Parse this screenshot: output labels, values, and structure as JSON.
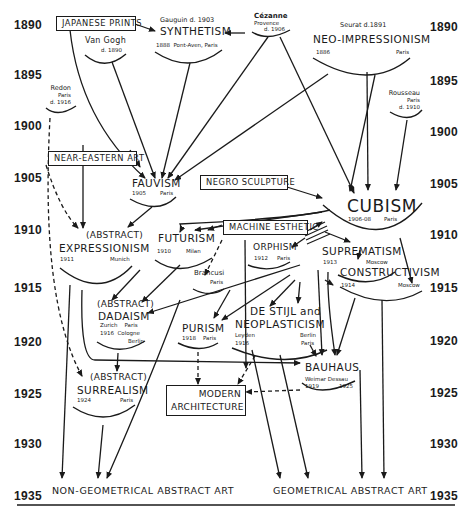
{
  "years": {
    "left": [
      "1890",
      "1895",
      "1900",
      "1905",
      "1910",
      "1915",
      "1920",
      "1925",
      "1930",
      "1935"
    ],
    "right": [
      "1890",
      "1895",
      "1900",
      "1905",
      "1910",
      "1915",
      "1920",
      "1925",
      "1930",
      "1935"
    ]
  },
  "boxes": {
    "japanese_prints": "JAPANESE PRINTS",
    "near_eastern_art": "NEAR-EASTERN ART",
    "negro_sculpture": "NEGRO SCULPTURE",
    "machine_esthetic": "MACHINE ESTHETIC",
    "modern_architecture_1": "MODERN",
    "modern_architecture_2": "ARCHITECTURE"
  },
  "nodes": {
    "van_gogh": {
      "name": "Van Gogh",
      "date": "d. 1890"
    },
    "gauguin": {
      "name": "Gauguin",
      "date": "d. 1903"
    },
    "synthetism": {
      "title": "SYNTHETISM",
      "year": "1888",
      "place": "Pont-Aven, Paris"
    },
    "cezanne": {
      "name": "Cézanne",
      "place": "Provence",
      "date": "d. 1906"
    },
    "seurat": {
      "name": "Seurat",
      "date": "d.1891"
    },
    "neo_impressionism": {
      "title": "NEO-IMPRESSIONISM",
      "year": "1886",
      "place": "Paris"
    },
    "redon": {
      "name": "Redon",
      "place": "Paris",
      "date": "d. 1916"
    },
    "rousseau": {
      "name": "Rousseau",
      "place": "Paris",
      "date": "d. 1910"
    },
    "fauvism": {
      "title": "FAUVISM",
      "year": "1905",
      "place": "Paris"
    },
    "cubism": {
      "title": "CUBISM",
      "year": "1906-08",
      "place": "Paris"
    },
    "abstract_expressionism": {
      "prefix": "(ABSTRACT)",
      "title": "EXPRESSIONISM",
      "year": "1911",
      "place": "Munich"
    },
    "futurism": {
      "title": "FUTURISM",
      "year": "1910",
      "place": "Milan"
    },
    "orphism": {
      "title": "ORPHISM",
      "year": "1912",
      "place": "Paris"
    },
    "suprematism": {
      "title": "SUPREMATISM",
      "year": "1913",
      "place": "Moscow"
    },
    "constructivism": {
      "title": "CONSTRUCTIVISM",
      "year": "1914",
      "place": "Moscow"
    },
    "brancusi": {
      "name": "Brancusi",
      "place": "Paris"
    },
    "abstract_dadaism": {
      "prefix": "(ABSTRACT)",
      "title": "DADAISM",
      "places1": "Zurich    Paris",
      "places2": "1916  Cologne",
      "places3": "Berlin"
    },
    "purism": {
      "title": "PURISM",
      "year": "1918",
      "place": "Paris"
    },
    "de_stijl": {
      "title1": "DE STIJL and",
      "title2": "NEOPLASTICISM",
      "place1": "Leyden",
      "year": "1916",
      "place2": "Berlin",
      "place3": "Paris"
    },
    "bauhaus": {
      "title": "BAUHAUS",
      "places": "Weimar Dessau",
      "year1": "1919",
      "year2": "1925"
    },
    "abstract_surrealism": {
      "prefix": "(ABSTRACT)",
      "title": "SURREALISM",
      "year": "1924",
      "place": "Paris"
    }
  },
  "outcomes": {
    "non_geometrical": "NON-GEOMETRICAL ABSTRACT ART",
    "geometrical": "GEOMETRICAL ABSTRACT ART"
  }
}
